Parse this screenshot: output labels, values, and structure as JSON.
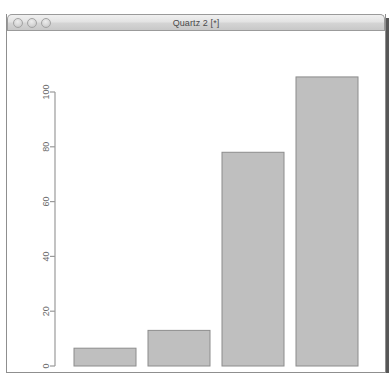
{
  "window": {
    "title": "Quartz 2 [*]",
    "controls": [
      {
        "name": "close-button",
        "label": "close"
      },
      {
        "name": "minimize-button",
        "label": "minimize"
      },
      {
        "name": "zoom-button",
        "label": "zoom"
      }
    ],
    "state": "inactive"
  },
  "top_strip": {
    "text": ""
  },
  "colors": {
    "bar_fill": "#bfbfbf",
    "bar_stroke": "#8c8c8c",
    "axis": "#9a9a9a",
    "tick_label": "#6b6b6b",
    "titlebar_text": "#4a4a4a",
    "window_bg": "#ffffff"
  },
  "chart_data": {
    "type": "bar",
    "title": "",
    "xlabel": "",
    "ylabel": "",
    "categories": [
      "1",
      "2",
      "3",
      "4"
    ],
    "values": [
      6.5,
      13,
      78,
      105.5
    ],
    "ylim": [
      0,
      108
    ],
    "yticks": [
      0,
      20,
      40,
      60,
      80,
      100
    ],
    "ytick_labels": [
      "0",
      "20",
      "40",
      "60",
      "80",
      "100"
    ],
    "ytick_label_rotation": 90,
    "grid": false,
    "legend": null,
    "bar_fill": "#bfbfbf",
    "bar_stroke": "#8c8c8c"
  }
}
